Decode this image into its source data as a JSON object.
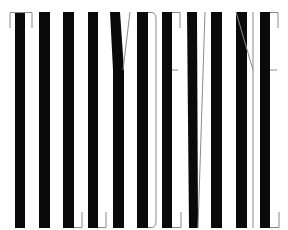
{
  "title": "TILLYDEVINE",
  "letters": [
    "T",
    "I",
    "L",
    "L",
    "Y",
    "D",
    "E",
    "V",
    "I",
    "N",
    "E"
  ],
  "colors": {
    "ink": "#0a0a0a",
    "hairline": "#8a8a8a",
    "background": "#ffffff"
  }
}
